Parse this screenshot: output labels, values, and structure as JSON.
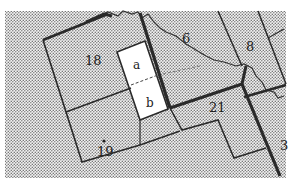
{
  "map": {
    "type": "parcel-map",
    "colors": {
      "background": "#ffffff",
      "stipple_dot": "#7a7a7a",
      "stipple_bg": "#f4f4f4",
      "boundary": "#2a2a2a",
      "highlight_parcel_fill": "#ffffff"
    },
    "parcels": [
      {
        "id": "18",
        "label": "18"
      },
      {
        "id": "19",
        "label": "19",
        "marker": "dot"
      },
      {
        "id": "a",
        "label": "a",
        "highlighted": true
      },
      {
        "id": "b",
        "label": "b",
        "highlighted": true
      },
      {
        "id": "6",
        "label": "6"
      },
      {
        "id": "8",
        "label": "8"
      },
      {
        "id": "21",
        "label": "21"
      },
      {
        "id": "3",
        "label": "3"
      }
    ],
    "features": [
      {
        "type": "river",
        "name": "river-line"
      },
      {
        "type": "dashed-divider",
        "between": [
          "a",
          "b"
        ]
      }
    ]
  }
}
